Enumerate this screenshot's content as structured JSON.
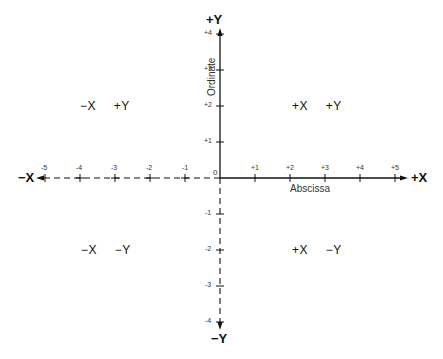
{
  "figure": {
    "axes": {
      "x_positive_label": "+X",
      "x_negative_label": "−X",
      "y_positive_label": "+Y",
      "y_negative_label": "−Y",
      "x_name": "Abscissa",
      "y_name": "Ordinate",
      "origin_label": "0"
    },
    "x_ticks": [
      "-5",
      "-4",
      "-3",
      "-2",
      "-1",
      "+1",
      "+2",
      "+3",
      "+4",
      "+5"
    ],
    "y_ticks": [
      "+4",
      "+3",
      "+2",
      "+1",
      "-1",
      "-2",
      "-3",
      "-4"
    ],
    "quadrants": {
      "q1": {
        "x": "+X",
        "y": "+Y"
      },
      "q2": {
        "x": "−X",
        "y": "+Y"
      },
      "q3": {
        "x": "−X",
        "y": "−Y"
      },
      "q4": {
        "x": "+X",
        "y": "−Y"
      }
    },
    "colors": {
      "ink": "#111111",
      "background": "#ffffff"
    }
  }
}
